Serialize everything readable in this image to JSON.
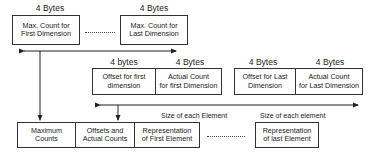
{
  "top_row": {
    "labels": [
      "4 Bytes",
      "4 Bytes"
    ],
    "boxes": [
      "Max. Count for First Dimension",
      "Max. Count for Last Dimension"
    ],
    "box_lines": [
      [
        "Max. Count for",
        "First Dimension"
      ],
      [
        "Max. Count for",
        "Last Dimension"
      ]
    ]
  },
  "middle_row": {
    "labels": [
      "4 bytes",
      "4 Bytes",
      "4 Bytes",
      "4 Bytes"
    ],
    "box_lines": [
      [
        "Offset for first",
        "dimension"
      ],
      [
        "Actual Count",
        "for first Dimension"
      ],
      [
        "Offset for Last",
        "Dimension"
      ],
      [
        "Actual Count",
        "for Last Dimension"
      ]
    ]
  },
  "bottom_row": {
    "size_labels": [
      "Size of each Element",
      "Size of each element"
    ],
    "box_lines": [
      [
        "Maximum",
        "Counts"
      ],
      [
        "Offsets and",
        "Actual Counts"
      ],
      [
        "Representation",
        "of First Element"
      ],
      [
        "Representation",
        "of last Element"
      ]
    ]
  }
}
